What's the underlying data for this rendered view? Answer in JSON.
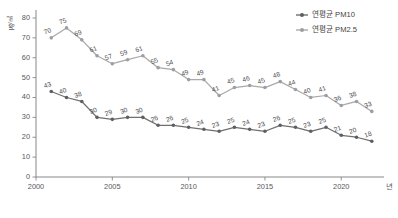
{
  "chart_data": {
    "type": "line",
    "title": "",
    "xlabel": "년",
    "ylabel": "㎍/㎥",
    "x": [
      2001,
      2002,
      2003,
      2004,
      2005,
      2006,
      2007,
      2008,
      2009,
      2010,
      2011,
      2012,
      2013,
      2014,
      2015,
      2016,
      2017,
      2018,
      2019,
      2020,
      2021,
      2022
    ],
    "xlim": [
      2000,
      2022.8
    ],
    "ylim": [
      0,
      82
    ],
    "xticks": [
      2000,
      2005,
      2010,
      2015,
      2020
    ],
    "xticklabels": [
      "2000",
      "2005",
      "2010",
      "2015",
      "2020"
    ],
    "yticks": [
      0,
      10,
      20,
      30,
      40,
      50,
      60,
      70,
      80
    ],
    "yticklabels": [
      "0",
      "10",
      "20",
      "30",
      "40",
      "50",
      "60",
      "70",
      "80"
    ],
    "grid": false,
    "legend_position": "top-right",
    "series": [
      {
        "name": "연평균 PM10",
        "color": "#6f6f72",
        "values": [
          43,
          40,
          38,
          30,
          29,
          30,
          30,
          26,
          26,
          25,
          24,
          23,
          25,
          24,
          23,
          26,
          25,
          23,
          25,
          21,
          20,
          18
        ]
      },
      {
        "name": "연평균 PM2.5",
        "color": "#a9a9ac",
        "values": [
          70,
          75,
          69,
          61,
          57,
          59,
          61,
          55,
          54,
          49,
          49,
          41,
          45,
          46,
          45,
          48,
          44,
          40,
          41,
          36,
          38,
          33
        ]
      }
    ]
  },
  "legend": {
    "items": [
      {
        "label": "연평균 PM10"
      },
      {
        "label": "연평균 PM2.5"
      }
    ]
  },
  "axes": {
    "y_unit_label": "㎍/㎥",
    "x_unit_label": "년"
  }
}
